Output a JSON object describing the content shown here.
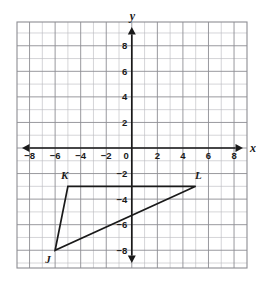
{
  "figure": {
    "kind": "coordinate-plane-triangle",
    "background_color": "#ffffff",
    "grid_color_minor": "#b9b9bd",
    "grid_color_major": "#8d8d93",
    "axis_color": "#1a1a1a",
    "shape_color": "#1a1a1a"
  },
  "chart_data": {
    "type": "scatter",
    "title": "",
    "subtitle": "",
    "xlabel": "x",
    "ylabel": "y",
    "xlim": [
      -9,
      9
    ],
    "ylim": [
      -9,
      9
    ],
    "grid": true,
    "legend": "none",
    "x_ticks": [
      -8,
      -6,
      -4,
      -2,
      0,
      2,
      4,
      6,
      8
    ],
    "y_ticks": [
      8,
      6,
      4,
      2,
      -2,
      -4,
      -6,
      -8
    ],
    "x_tick_labels": [
      "-8",
      "-6",
      "-4",
      "-2",
      "0",
      "2",
      "4",
      "6",
      "8"
    ],
    "y_tick_labels": [
      "8",
      "6",
      "4",
      "2",
      "-2",
      "-4",
      "-6",
      "-8"
    ],
    "tick_step": 2,
    "grid_step": 1,
    "annotations": [
      {
        "text": "y",
        "role": "y-axis-name",
        "x": 0,
        "y": 9.8
      },
      {
        "text": "x",
        "role": "x-axis-name",
        "x": 10.0,
        "y": 0
      }
    ],
    "series": [
      {
        "name": "Triangle JKL",
        "type": "polygon",
        "closed": true,
        "points": [
          {
            "label": "J",
            "x": -6,
            "y": -8
          },
          {
            "label": "K",
            "x": -5,
            "y": -3
          },
          {
            "label": "L",
            "x": 5,
            "y": -3
          }
        ],
        "edges": [
          {
            "from": "J",
            "to": "K"
          },
          {
            "from": "K",
            "to": "L"
          },
          {
            "from": "L",
            "to": "J"
          }
        ]
      }
    ]
  },
  "vertex_labels": [
    {
      "name": "J",
      "text": "J",
      "x": -6,
      "y": -8,
      "dx": -0.55,
      "dy": -0.75
    },
    {
      "name": "K",
      "text": "K",
      "x": -5,
      "y": -3,
      "dx": -0.25,
      "dy": 0.85
    },
    {
      "name": "L",
      "text": "L",
      "x": 5,
      "y": -3,
      "dx": 0.2,
      "dy": 0.85
    }
  ],
  "axis_names": {
    "x": "x",
    "y": "y"
  }
}
